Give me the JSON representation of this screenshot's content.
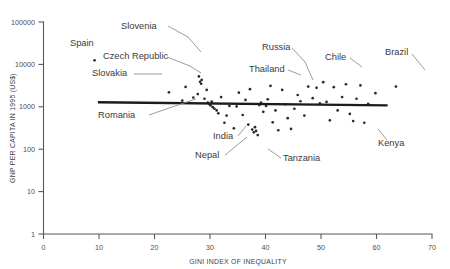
{
  "chart_data": {
    "type": "scatter",
    "title": "",
    "xlabel": "GINI INDEX OF INEQUALITY",
    "ylabel": "GNP PER CAPITA IN 1995 (US$)",
    "xlim": [
      0,
      70
    ],
    "ylim": [
      1,
      100000
    ],
    "yscale": "log",
    "xscale": "linear",
    "grid": false,
    "legend": null,
    "xticks": [
      "0",
      "10",
      "20",
      "30",
      "40",
      "50",
      "60",
      "70"
    ],
    "xtick_values": [
      0,
      10,
      20,
      30,
      40,
      50,
      60,
      70
    ],
    "yticks": [
      "1",
      "10",
      "100",
      "1000",
      "10000",
      "100000"
    ],
    "ytick_values": [
      1,
      10,
      100,
      1000,
      10000,
      100000
    ],
    "points": [
      {
        "x": 9.2,
        "y": 12500
      },
      {
        "x": 22.6,
        "y": 2200
      },
      {
        "x": 25.0,
        "y": 1400
      },
      {
        "x": 25.6,
        "y": 2950
      },
      {
        "x": 27.0,
        "y": 1650
      },
      {
        "x": 27.8,
        "y": 2000
      },
      {
        "x": 28.0,
        "y": 5200
      },
      {
        "x": 28.2,
        "y": 3900
      },
      {
        "x": 28.4,
        "y": 3500
      },
      {
        "x": 28.5,
        "y": 4300
      },
      {
        "x": 29.0,
        "y": 1550
      },
      {
        "x": 29.4,
        "y": 2500
      },
      {
        "x": 29.6,
        "y": 1250
      },
      {
        "x": 29.9,
        "y": 1150
      },
      {
        "x": 30.1,
        "y": 1080
      },
      {
        "x": 30.3,
        "y": 1320
      },
      {
        "x": 30.5,
        "y": 980
      },
      {
        "x": 30.8,
        "y": 900
      },
      {
        "x": 31.5,
        "y": 700
      },
      {
        "x": 31.2,
        "y": 820
      },
      {
        "x": 32.0,
        "y": 1700
      },
      {
        "x": 32.6,
        "y": 420
      },
      {
        "x": 33.0,
        "y": 620
      },
      {
        "x": 33.5,
        "y": 1050
      },
      {
        "x": 34.3,
        "y": 310
      },
      {
        "x": 34.8,
        "y": 1020
      },
      {
        "x": 35.2,
        "y": 2150
      },
      {
        "x": 35.9,
        "y": 640
      },
      {
        "x": 36.4,
        "y": 1450
      },
      {
        "x": 36.9,
        "y": 380
      },
      {
        "x": 37.2,
        "y": 2600
      },
      {
        "x": 37.6,
        "y": 290
      },
      {
        "x": 37.9,
        "y": 250
      },
      {
        "x": 38.1,
        "y": 330
      },
      {
        "x": 38.3,
        "y": 270
      },
      {
        "x": 38.6,
        "y": 215
      },
      {
        "x": 38.9,
        "y": 1100
      },
      {
        "x": 39.2,
        "y": 1250
      },
      {
        "x": 39.6,
        "y": 760
      },
      {
        "x": 40.1,
        "y": 1050
      },
      {
        "x": 40.4,
        "y": 1500
      },
      {
        "x": 40.9,
        "y": 3100
      },
      {
        "x": 41.3,
        "y": 430
      },
      {
        "x": 41.8,
        "y": 820
      },
      {
        "x": 42.3,
        "y": 280
      },
      {
        "x": 43.0,
        "y": 2500
      },
      {
        "x": 43.5,
        "y": 1150
      },
      {
        "x": 44.0,
        "y": 540
      },
      {
        "x": 44.6,
        "y": 300
      },
      {
        "x": 45.2,
        "y": 900
      },
      {
        "x": 45.8,
        "y": 1900
      },
      {
        "x": 46.3,
        "y": 1350
      },
      {
        "x": 47.0,
        "y": 620
      },
      {
        "x": 47.7,
        "y": 3000
      },
      {
        "x": 48.5,
        "y": 1600
      },
      {
        "x": 49.2,
        "y": 2800
      },
      {
        "x": 49.8,
        "y": 1200
      },
      {
        "x": 50.4,
        "y": 3800
      },
      {
        "x": 51.0,
        "y": 1300
      },
      {
        "x": 51.6,
        "y": 480
      },
      {
        "x": 52.3,
        "y": 2900
      },
      {
        "x": 53.0,
        "y": 820
      },
      {
        "x": 53.8,
        "y": 1700
      },
      {
        "x": 54.5,
        "y": 3400
      },
      {
        "x": 55.2,
        "y": 680
      },
      {
        "x": 55.8,
        "y": 460
      },
      {
        "x": 56.4,
        "y": 1550
      },
      {
        "x": 57.1,
        "y": 3200
      },
      {
        "x": 57.8,
        "y": 420
      },
      {
        "x": 58.5,
        "y": 1180
      },
      {
        "x": 59.8,
        "y": 2100
      },
      {
        "x": 63.5,
        "y": 3000
      }
    ],
    "trendline": {
      "x_start": 9.8,
      "y_start": 1280,
      "x_end": 62.0,
      "y_end": 1080
    },
    "annotations": [
      {
        "label": "Spain",
        "text_x": 70,
        "text_y": 46,
        "point_x": 9.2,
        "point_y": 12500,
        "leader": false
      },
      {
        "label": "Slovenia",
        "text_x": 121,
        "text_y": 29,
        "point_x": 28.0,
        "point_y": 5200,
        "leader": true,
        "leader_path": "M 168 26 L 188 37 L 201 52"
      },
      {
        "label": "Czech Republic",
        "text_x": 103,
        "text_y": 59,
        "point_x": 28.4,
        "point_y": 3500,
        "leader": true,
        "leader_path": "M 167 57 L 190 66 L 201 73"
      },
      {
        "label": "Slovakia",
        "text_x": 92,
        "text_y": 76,
        "point_x": 25.6,
        "point_y": 2950,
        "leader": true,
        "leader_path": "M 134 74 L 162 74"
      },
      {
        "label": "Romania",
        "text_x": 98,
        "text_y": 118,
        "point_x": 29.9,
        "point_y": 1150,
        "leader": true,
        "leader_path": "M 149 115 L 175 106 L 196 99"
      },
      {
        "label": "Thailand",
        "text_x": 249,
        "text_y": 72,
        "point_x": 37.2,
        "point_y": 2600,
        "leader": true,
        "leader_path": "M 288 70 L 301 75"
      },
      {
        "label": "Russia",
        "text_x": 262,
        "text_y": 50,
        "point_x": 40.9,
        "point_y": 3100,
        "leader": true,
        "leader_path": "M 292 48 L 305 62 L 313 80"
      },
      {
        "label": "Chile",
        "text_x": 325,
        "text_y": 60,
        "point_x": 49.2,
        "point_y": 2800,
        "leader": true,
        "leader_path": "M 350 58 L 362 67"
      },
      {
        "label": "Brazil",
        "text_x": 385,
        "text_y": 55,
        "point_x": 63.5,
        "point_y": 3000,
        "leader": true,
        "leader_path": "M 412 54 L 425 70"
      },
      {
        "label": "India",
        "text_x": 213,
        "text_y": 139,
        "point_x": 37.6,
        "point_y": 290,
        "leader": true,
        "leader_path": "M 238 136 L 246 126"
      },
      {
        "label": "Nepal",
        "text_x": 195,
        "text_y": 158,
        "point_x": 38.3,
        "point_y": 270,
        "leader": true,
        "leader_path": "M 225 155 L 247 137"
      },
      {
        "label": "Tanzania",
        "text_x": 283,
        "text_y": 161,
        "point_x": 42.3,
        "point_y": 280,
        "leader": true,
        "leader_path": "M 281 158 L 268 149"
      },
      {
        "label": "Kenya",
        "text_x": 378,
        "text_y": 146,
        "point_x": 55.8,
        "point_y": 460,
        "leader": true,
        "leader_path": "M 387 140 L 378 129"
      }
    ]
  },
  "axes": {
    "y_title": "GNP PER CAPITA IN 1995 (US$)",
    "x_title": "GINI INDEX OF INEQUALITY",
    "y_tick_labels": [
      "100000",
      "10000",
      "1000",
      "100",
      "10",
      "1"
    ],
    "x_tick_labels": [
      "0",
      "10",
      "20",
      "30",
      "40",
      "50",
      "60",
      "70"
    ]
  },
  "colors": {
    "point": "#2b2b2d",
    "trendline": "#1c1c1e",
    "axis": "#58585a",
    "leader": "#8a8a8c",
    "text": "#3a3a3c",
    "background": "#ffffff"
  }
}
